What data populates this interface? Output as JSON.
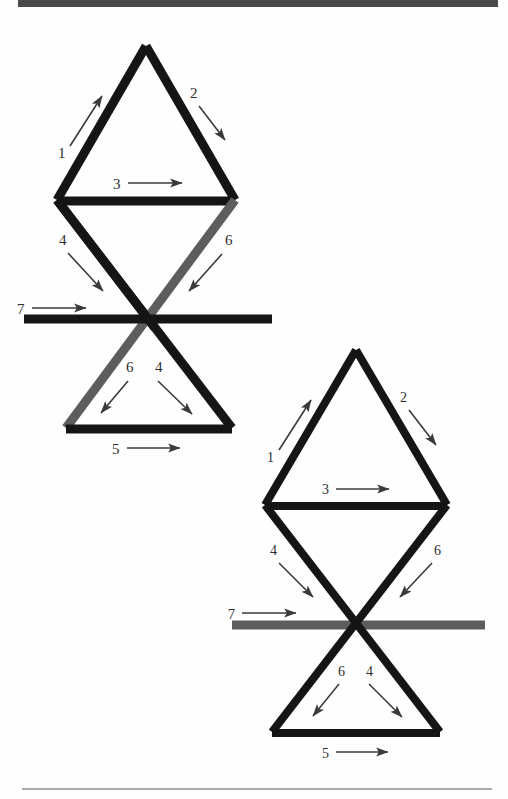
{
  "page": {
    "background_color": "#fefefe",
    "header_rule_color": "#4a4a4a",
    "footer_rule_color": "#a9a9a9",
    "stroke_dark": "#151515",
    "stroke_grey": "#5d5d5d",
    "arrow_color": "#3a3a3a",
    "label_color": "#2e2e2e"
  },
  "figures": [
    {
      "id": "figure-top-left",
      "labels": {
        "upper_left_edge": "1",
        "upper_right_edge": "2",
        "middle_bar": "3",
        "upper_descending_left": "4",
        "lower_descending_right": "4",
        "upper_descending_right": "6",
        "lower_descending_left": "6",
        "bottom_base": "5",
        "horizontal_crossbar": "7"
      }
    },
    {
      "id": "figure-bottom-right",
      "labels": {
        "upper_left_edge": "1",
        "upper_right_edge": "2",
        "middle_bar": "3",
        "upper_descending_left": "4",
        "lower_descending_right": "4",
        "upper_descending_right": "6",
        "lower_descending_left": "6",
        "bottom_base": "5",
        "horizontal_crossbar": "7"
      }
    }
  ]
}
